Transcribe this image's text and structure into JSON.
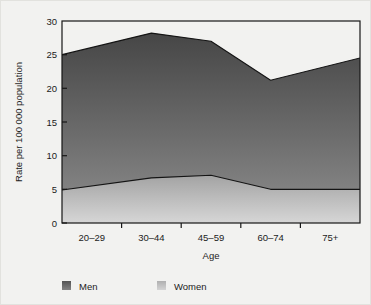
{
  "chart_data": {
    "type": "area",
    "title": "",
    "subtitle": "",
    "xlabel": "Age",
    "ylabel": "Rate per 100 000 population",
    "categories": [
      "20–29",
      "30–44",
      "45–59",
      "60–74",
      "75+"
    ],
    "ylim": [
      0,
      30
    ],
    "yticks": [
      0,
      5,
      10,
      15,
      20,
      25,
      30
    ],
    "ytick_labels": [
      "0",
      "5",
      "10",
      "15",
      "20",
      "25",
      "30"
    ],
    "grid": false,
    "stacked": false,
    "legend_position": "bottom",
    "series": [
      {
        "name": "Men",
        "values": [
          25.0,
          28.2,
          27.0,
          21.2,
          24.5
        ],
        "color": "#6e6e6e",
        "line_color": "#141414"
      },
      {
        "name": "Women",
        "values": [
          4.9,
          6.7,
          7.1,
          5.0,
          5.0
        ],
        "color": "#b9b9b9",
        "line_color": "#141414"
      }
    ]
  },
  "legend": {
    "items": [
      {
        "label": "Men",
        "swatch": "#6e6e6e"
      },
      {
        "label": "Women",
        "swatch": "#bdbdbd"
      }
    ]
  },
  "axes": {
    "y_title": "Rate per 100 000 population",
    "x_title": "Age"
  },
  "colors": {
    "background": "#f2f2f0",
    "men_top": "#4a4a4a",
    "men_bottom": "#8d8d8d",
    "women_top": "#a8a8a8",
    "women_bottom": "#d2d2d2",
    "axis": "#171717",
    "text": "#1b1b1b"
  }
}
